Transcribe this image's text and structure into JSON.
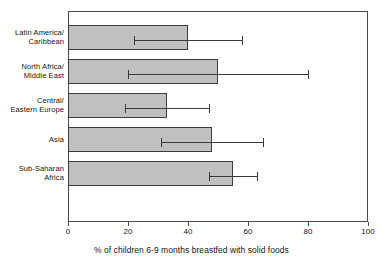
{
  "chart_data": {
    "type": "bar",
    "orientation": "horizontal",
    "title": "",
    "xlabel": "% of children 6-9 months breastfed with solid foods",
    "ylabel": "",
    "xlim": [
      0,
      100
    ],
    "xticks": [
      0,
      20,
      40,
      60,
      80,
      100
    ],
    "xtick_labels": [
      "0",
      "20",
      "40",
      "60",
      "80",
      "100"
    ],
    "grid": false,
    "legend": null,
    "bar_color": "#c0c0c0",
    "bar_edge_color": "#3d3d3d",
    "error_bar_color": "#3a3a3a",
    "axis_color": "#4a4a4a",
    "categories": [
      "Latin America/\nCaribbean",
      "North Africa/\nMiddle East",
      "Central/\nEastern Europe",
      "Asia",
      "Sub-Saharan\nAfrica"
    ],
    "values": [
      40,
      50,
      33,
      48,
      55
    ],
    "error_low": [
      22,
      20,
      19,
      31,
      47
    ],
    "error_high": [
      58,
      80,
      47,
      65,
      63
    ],
    "bars": [
      {
        "category": "Latin America/\nCaribbean",
        "value": 40,
        "low": 22,
        "high": 58
      },
      {
        "category": "North Africa/\nMiddle East",
        "value": 50,
        "low": 20,
        "high": 80
      },
      {
        "category": "Central/\nEastern Europe",
        "value": 33,
        "low": 19,
        "high": 47
      },
      {
        "category": "Asia",
        "value": 48,
        "low": 31,
        "high": 65
      },
      {
        "category": "Sub-Saharan\nAfrica",
        "value": 55,
        "low": 47,
        "high": 63
      }
    ]
  },
  "title_sliver": {
    "text": ""
  }
}
